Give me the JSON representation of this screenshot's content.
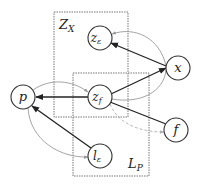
{
  "diagram": {
    "type": "graphical-model",
    "colors": {
      "node_stroke": "#333333",
      "edge_black": "#222222",
      "edge_gray": "#9a9a9a",
      "box_stroke": "#777777",
      "dashed_edge": "#b0b0b0",
      "background": "#ffffff"
    },
    "boxes": [
      {
        "id": "Zx",
        "label": "Z",
        "subscript": "X",
        "x": 54,
        "y": 12,
        "w": 74,
        "h": 105
      },
      {
        "id": "Lp",
        "label": "L",
        "subscript": "P",
        "x": 73,
        "y": 73,
        "w": 76,
        "h": 103
      }
    ],
    "nodes": [
      {
        "id": "p",
        "label": "p",
        "subscript": "",
        "cx": 23,
        "cy": 97,
        "r": 12
      },
      {
        "id": "ze",
        "label": "z",
        "subscript": "ε",
        "cx": 100,
        "cy": 38,
        "r": 12
      },
      {
        "id": "zf",
        "label": "z",
        "subscript": "f",
        "cx": 100,
        "cy": 97,
        "r": 12
      },
      {
        "id": "x",
        "label": "x",
        "subscript": "",
        "cx": 178,
        "cy": 68,
        "r": 12
      },
      {
        "id": "f",
        "label": "f",
        "subscript": "",
        "cx": 176,
        "cy": 130,
        "r": 12
      },
      {
        "id": "le",
        "label": "l",
        "subscript": "ε",
        "cx": 100,
        "cy": 156,
        "r": 12
      }
    ],
    "edges": [
      {
        "from": "x",
        "to": "ze",
        "style": "solid-black"
      },
      {
        "from": "zf",
        "to": "x",
        "style": "solid-black"
      },
      {
        "from": "zf",
        "to": "p",
        "style": "solid-black"
      },
      {
        "from": "zf",
        "to": "f",
        "style": "solid-black"
      },
      {
        "from": "le",
        "to": "p",
        "style": "solid-black"
      },
      {
        "from": "x",
        "to": "ze",
        "style": "curved-gray"
      },
      {
        "from": "x",
        "to": "zf",
        "style": "curved-gray"
      },
      {
        "from": "p",
        "to": "zf",
        "style": "curved-gray"
      },
      {
        "from": "p",
        "to": "le",
        "style": "curved-gray"
      },
      {
        "from": "zf",
        "to": "f",
        "style": "dashed-gray"
      }
    ]
  }
}
